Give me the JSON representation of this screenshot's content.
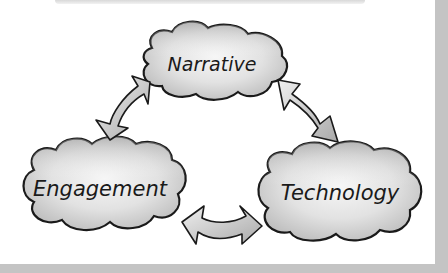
{
  "diagram": {
    "nodes": [
      {
        "id": "narrative",
        "label": "Narrative"
      },
      {
        "id": "engagement",
        "label": "Engagement"
      },
      {
        "id": "technology",
        "label": "Technology"
      }
    ],
    "edges": [
      {
        "from": "narrative",
        "to": "engagement",
        "type": "bidirectional"
      },
      {
        "from": "narrative",
        "to": "technology",
        "type": "bidirectional"
      },
      {
        "from": "engagement",
        "to": "technology",
        "type": "bidirectional"
      }
    ],
    "style": "hand-drawn clouds with gray watercolor shading",
    "colors": {
      "outline": "#1a1a1a",
      "fill": "#cfcfcf",
      "fill_light": "#f4f4f4",
      "border": "#c4c4c4"
    }
  }
}
